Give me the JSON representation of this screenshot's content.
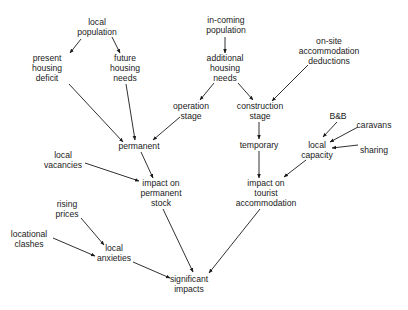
{
  "diagram": {
    "nodes": [
      {
        "id": "local_population",
        "lines": [
          "local",
          "population"
        ],
        "x": 97,
        "y": 27
      },
      {
        "id": "present_housing_deficit",
        "lines": [
          "present",
          "housing",
          "deficit"
        ],
        "x": 47,
        "y": 68
      },
      {
        "id": "future_housing_needs",
        "lines": [
          "future",
          "housing",
          "needs"
        ],
        "x": 125,
        "y": 68
      },
      {
        "id": "in_coming_population",
        "lines": [
          "in-coming",
          "population"
        ],
        "x": 226,
        "y": 25
      },
      {
        "id": "additional_housing_needs",
        "lines": [
          "additional",
          "housing",
          "needs"
        ],
        "x": 225,
        "y": 68
      },
      {
        "id": "on_site_accommodation_deductions",
        "lines": [
          "on-site",
          "accommodation",
          "deductions"
        ],
        "x": 329,
        "y": 51
      },
      {
        "id": "operation_stage",
        "lines": [
          "operation",
          "stage"
        ],
        "x": 191,
        "y": 111
      },
      {
        "id": "construction_stage",
        "lines": [
          "construction",
          "stage"
        ],
        "x": 260,
        "y": 111
      },
      {
        "id": "permanent",
        "lines": [
          "permanent"
        ],
        "x": 139,
        "y": 146
      },
      {
        "id": "temporary",
        "lines": [
          "temporary"
        ],
        "x": 259,
        "y": 145
      },
      {
        "id": "bnb",
        "lines": [
          "B&B"
        ],
        "x": 338,
        "y": 116
      },
      {
        "id": "caravans",
        "lines": [
          "caravans"
        ],
        "x": 374,
        "y": 125
      },
      {
        "id": "sharing",
        "lines": [
          "sharing",
          ""
        ],
        "x": 374,
        "y": 150
      },
      {
        "id": "local_capacity",
        "lines": [
          "local",
          "capacity"
        ],
        "x": 317,
        "y": 150
      },
      {
        "id": "local_vacancies",
        "lines": [
          "local",
          "vacancies"
        ],
        "x": 63,
        "y": 160
      },
      {
        "id": "impact_on_permanent_stock",
        "lines": [
          "impact on",
          "permanent",
          "stock"
        ],
        "x": 161,
        "y": 193
      },
      {
        "id": "impact_on_tourist_accommodation",
        "lines": [
          "impact on",
          "tourist",
          "accommodation"
        ],
        "x": 266,
        "y": 193
      },
      {
        "id": "rising_prices",
        "lines": [
          "rising",
          "prices"
        ],
        "x": 67,
        "y": 209
      },
      {
        "id": "locational_clashes",
        "lines": [
          "locational",
          "clashes"
        ],
        "x": 29,
        "y": 239
      },
      {
        "id": "local_anxieties",
        "lines": [
          "local",
          "anxieties"
        ],
        "x": 114,
        "y": 253
      },
      {
        "id": "significant_impacts",
        "lines": [
          "significant",
          "impacts"
        ],
        "x": 189,
        "y": 284
      }
    ],
    "edges": [
      {
        "from": "local_population",
        "to": "present_housing_deficit",
        "x1": 81,
        "y1": 39,
        "x2": 70,
        "y2": 53
      },
      {
        "from": "local_population",
        "to": "future_housing_needs",
        "x1": 112,
        "y1": 37,
        "x2": 120,
        "y2": 53
      },
      {
        "from": "in_coming_population",
        "to": "additional_housing_needs",
        "x1": 225,
        "y1": 37,
        "x2": 225,
        "y2": 53
      },
      {
        "from": "additional_housing_needs",
        "to": "operation_stage",
        "x1": 214,
        "y1": 83,
        "x2": 200,
        "y2": 100
      },
      {
        "from": "additional_housing_needs",
        "to": "construction_stage",
        "x1": 238,
        "y1": 83,
        "x2": 253,
        "y2": 100
      },
      {
        "from": "on_site_accommodation_deductions",
        "to": "construction_stage",
        "x1": 308,
        "y1": 65,
        "x2": 272,
        "y2": 101
      },
      {
        "from": "present_housing_deficit",
        "to": "permanent",
        "x1": 69,
        "y1": 84,
        "x2": 123,
        "y2": 142
      },
      {
        "from": "future_housing_needs",
        "to": "permanent",
        "x1": 126,
        "y1": 84,
        "x2": 135,
        "y2": 140
      },
      {
        "from": "operation_stage",
        "to": "permanent",
        "x1": 180,
        "y1": 117,
        "x2": 153,
        "y2": 140
      },
      {
        "from": "construction_stage",
        "to": "temporary",
        "x1": 259,
        "y1": 122,
        "x2": 259,
        "y2": 139
      },
      {
        "from": "bnb",
        "to": "local_capacity",
        "x1": 337,
        "y1": 122,
        "x2": 323,
        "y2": 137
      },
      {
        "from": "caravans",
        "to": "local_capacity",
        "x1": 358,
        "y1": 127,
        "x2": 330,
        "y2": 142
      },
      {
        "from": "sharing",
        "to": "local_capacity",
        "x1": 358,
        "y1": 145,
        "x2": 332,
        "y2": 148
      },
      {
        "from": "permanent",
        "to": "impact_on_permanent_stock",
        "x1": 141,
        "y1": 152,
        "x2": 153,
        "y2": 178
      },
      {
        "from": "local_vacancies",
        "to": "impact_on_permanent_stock",
        "x1": 85,
        "y1": 163,
        "x2": 139,
        "y2": 181
      },
      {
        "from": "temporary",
        "to": "impact_on_tourist_accommodation",
        "x1": 259,
        "y1": 151,
        "x2": 259,
        "y2": 178
      },
      {
        "from": "local_capacity",
        "to": "impact_on_tourist_accommodation",
        "x1": 306,
        "y1": 160,
        "x2": 284,
        "y2": 177
      },
      {
        "from": "rising_prices",
        "to": "local_anxieties",
        "x1": 81,
        "y1": 218,
        "x2": 104,
        "y2": 245
      },
      {
        "from": "locational_clashes",
        "to": "local_anxieties",
        "x1": 53,
        "y1": 238,
        "x2": 95,
        "y2": 256
      },
      {
        "from": "impact_on_permanent_stock",
        "to": "significant_impacts",
        "x1": 163,
        "y1": 209,
        "x2": 193,
        "y2": 272
      },
      {
        "from": "impact_on_tourist_accommodation",
        "to": "significant_impacts",
        "x1": 260,
        "y1": 209,
        "x2": 209,
        "y2": 273
      },
      {
        "from": "local_anxieties",
        "to": "significant_impacts",
        "x1": 133,
        "y1": 262,
        "x2": 170,
        "y2": 278
      }
    ]
  }
}
